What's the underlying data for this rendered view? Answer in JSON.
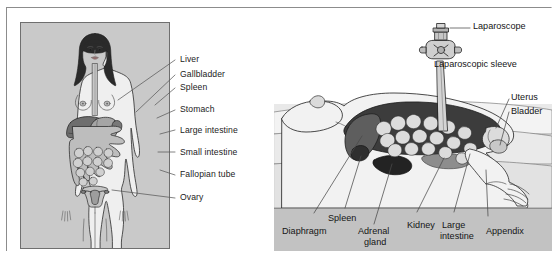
{
  "figure": {
    "panel_a_name": "anterior-view-female-abdominal-organs",
    "panel_b_name": "supine-laparoscopic-view"
  },
  "panel_a": {
    "caption": "",
    "labels": [
      {
        "id": "liver",
        "text": "Liver"
      },
      {
        "id": "gallbladder",
        "text": "Gallbladder"
      },
      {
        "id": "spleen",
        "text": "Spleen"
      },
      {
        "id": "stomach",
        "text": "Stomach"
      },
      {
        "id": "large-intestine",
        "text": "Large intestine"
      },
      {
        "id": "small-intestine",
        "text": "Small intestine"
      },
      {
        "id": "fallopian-tube",
        "text": "Fallopian tube"
      },
      {
        "id": "ovary",
        "text": "Ovary"
      }
    ]
  },
  "panel_b": {
    "labels": [
      {
        "id": "laparoscope",
        "text": "Laparoscope"
      },
      {
        "id": "laparoscopic-sleeve",
        "text": "Laparoscopic sleeve"
      },
      {
        "id": "uterus",
        "text": "Uterus"
      },
      {
        "id": "bladder",
        "text": "Bladder"
      },
      {
        "id": "spleen",
        "text": "Spleen"
      },
      {
        "id": "diaphragm",
        "text": "Diaphragm"
      },
      {
        "id": "adrenal-gland-l1",
        "text": "Adrenal"
      },
      {
        "id": "adrenal-gland-l2",
        "text": "gland"
      },
      {
        "id": "kidney",
        "text": "Kidney"
      },
      {
        "id": "large-intestine-l1",
        "text": "Large"
      },
      {
        "id": "large-intestine-l2",
        "text": "intestine"
      },
      {
        "id": "appendix",
        "text": "Appendix"
      }
    ]
  },
  "colors": {
    "panel_a_background": "#c9c9c9",
    "panel_b_footer": "#c2c2c2",
    "skin": "#efefef",
    "hair": "#2a2a2a",
    "liver": "#6e6e6e",
    "stomach": "#9a9a9a",
    "intestine": "#b4b4b4",
    "cavity_dark": "#3a3a3a",
    "outline": "#2b2b2b",
    "leader_line": "#5a5a5a",
    "text": "#1b1b1b"
  }
}
